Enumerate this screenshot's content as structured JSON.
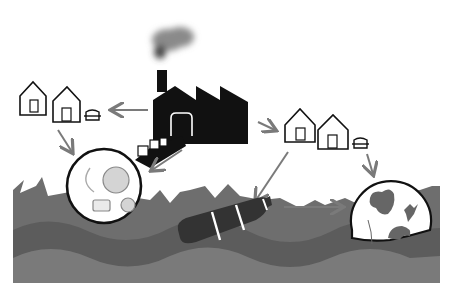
{
  "diagram": {
    "type": "illustration",
    "colors": {
      "background": "#ffffff",
      "ink": "#111111",
      "arrow": "#7a7a7a",
      "sea_top": "#6a6a6a",
      "sea_mid": "#585858",
      "sea_bottom": "#4e4e4e",
      "bottle": "#333333",
      "land": "#666666",
      "microplastic": "#d4d4d4",
      "smoke": "#7d7d7d"
    },
    "nodes": [
      {
        "id": "factory",
        "icon": "factory-icon",
        "label": ""
      },
      {
        "id": "houses-left",
        "icon": "house-icon",
        "label": ""
      },
      {
        "id": "car-left",
        "icon": "car-icon",
        "label": ""
      },
      {
        "id": "houses-right",
        "icon": "house-icon",
        "label": ""
      },
      {
        "id": "car-right",
        "icon": "car-icon",
        "label": ""
      },
      {
        "id": "pellets",
        "icon": "pellet-boxes-icon",
        "label": ""
      },
      {
        "id": "microplastics",
        "icon": "magnified-microplastics-icon",
        "label": ""
      },
      {
        "id": "bottle",
        "icon": "plastic-bottle-icon",
        "label": ""
      },
      {
        "id": "globe",
        "icon": "globe-icon",
        "label": ""
      },
      {
        "id": "ocean",
        "icon": "ocean-waves-icon",
        "label": ""
      }
    ],
    "edges": [
      {
        "from": "factory",
        "to": "houses-left"
      },
      {
        "from": "factory",
        "to": "houses-right"
      },
      {
        "from": "houses-left",
        "to": "microplastics"
      },
      {
        "from": "factory",
        "to": "microplastics"
      },
      {
        "from": "houses-right",
        "to": "bottle"
      },
      {
        "from": "houses-right",
        "to": "globe"
      },
      {
        "from": "bottle",
        "to": "globe"
      }
    ],
    "caption": ""
  }
}
